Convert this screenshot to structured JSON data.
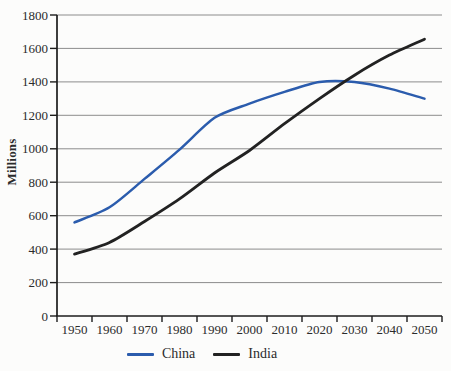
{
  "chart_data": {
    "type": "line",
    "title": "",
    "xlabel": "",
    "ylabel": "Millions",
    "categories": [
      "1950",
      "1960",
      "1970",
      "1980",
      "1990",
      "2000",
      "2010",
      "2020",
      "2030",
      "2040",
      "2050"
    ],
    "series": [
      {
        "name": "China",
        "color": "#2b5cad",
        "stroke_width": 2.5,
        "values": [
          560,
          650,
          820,
          995,
          1185,
          1270,
          1340,
          1400,
          1400,
          1360,
          1300
        ]
      },
      {
        "name": "India",
        "color": "#222222",
        "stroke_width": 2.8,
        "values": [
          370,
          440,
          565,
          700,
          855,
          990,
          1150,
          1300,
          1440,
          1560,
          1655
        ]
      }
    ],
    "ylim": [
      0,
      1800
    ],
    "ytick_step": 200,
    "grid": true,
    "legend_position": "bottom",
    "axis_color": "#1c1c1c",
    "grid_color": "#8c8c8c",
    "text_color": "#2b2b2b",
    "background": "#fcfcfb"
  }
}
